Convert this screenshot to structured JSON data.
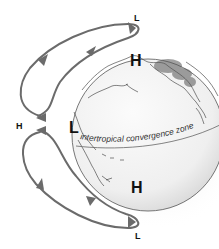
{
  "diagram": {
    "labels": {
      "low_top": "L",
      "high_north_globe": "H",
      "high_left": "H",
      "low_globe": "L",
      "itcz": "intertropical convergence zone",
      "high_south_globe": "H",
      "low_bottom": "L"
    },
    "colors": {
      "arrow": "#6b6b6b",
      "globe_fill": "#f2f2f2",
      "globe_shadow": "#d6d6d6",
      "coastline": "#333333",
      "label": "#111111"
    }
  }
}
